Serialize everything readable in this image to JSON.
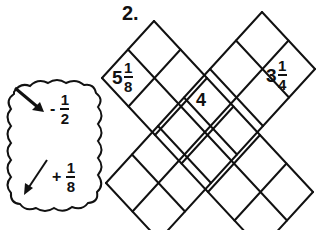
{
  "problem": {
    "number": "2."
  },
  "cloud": {
    "rules": [
      {
        "direction": "down-right",
        "icon": "arrow-down-right-icon",
        "sign": "-",
        "numerator": "1",
        "denominator": "2"
      },
      {
        "direction": "down-left",
        "icon": "arrow-down-left-icon",
        "sign": "+",
        "numerator": "1",
        "denominator": "8"
      }
    ]
  },
  "grid": {
    "cells": [
      {
        "position": "left-tip",
        "whole": "5",
        "numerator": "1",
        "denominator": "8"
      },
      {
        "position": "center",
        "value": "4"
      },
      {
        "position": "right-tip",
        "whole": "3",
        "numerator": "1",
        "denominator": "4"
      }
    ]
  },
  "colors": {
    "ink": "#111111",
    "background": "#ffffff"
  }
}
